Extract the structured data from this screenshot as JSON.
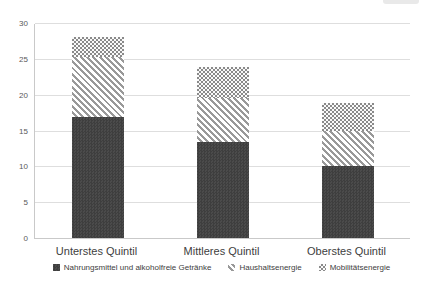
{
  "chart_data": {
    "type": "bar",
    "stacked": true,
    "title": "",
    "xlabel": "",
    "ylabel": "",
    "categories": [
      "Unterstes Quintil",
      "Mittleres Quintil",
      "Oberstes Quintil"
    ],
    "series": [
      {
        "name": "Nahrungsmittel und alkoholfreie Getränke",
        "slug": "nahrungsmittel",
        "values": [
          16.9,
          13.4,
          10.1
        ],
        "fill": "dark-checker",
        "color": "#3e3e3e",
        "color2": "#4b4b4b"
      },
      {
        "name": "Haushaltsenergie",
        "slug": "haushaltsenergie",
        "values": [
          8.4,
          6.1,
          4.8
        ],
        "fill": "diagonal-stripes",
        "color": "#999999",
        "color2": "#ffffff"
      },
      {
        "name": "Mobilitätsenergie",
        "slug": "mobilitaetsenergie",
        "values": [
          2.7,
          4.3,
          3.9
        ],
        "fill": "small-checker",
        "color": "#8a8a8a",
        "color2": "#fafafa"
      }
    ],
    "stack_totals": [
      28.0,
      23.8,
      18.8
    ],
    "ylim": [
      0,
      30
    ],
    "ytick_step": 5,
    "ytick_labels": [
      "0",
      "5",
      "10",
      "15",
      "20",
      "25",
      "30"
    ],
    "grid": "horizontal",
    "legend_position": "bottom",
    "gridline_color": "#dedede",
    "axis_line_color": "#c9c9c9",
    "tick_label_color": "#595959",
    "category_label_color": "#404040"
  }
}
